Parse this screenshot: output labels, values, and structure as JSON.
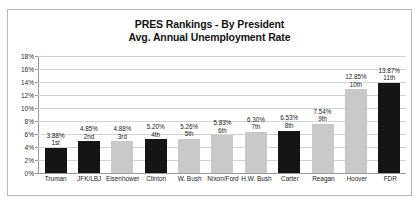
{
  "chart_data": {
    "type": "bar",
    "title": "PRES Rankings - By President",
    "subtitle": "Avg. Annual Unemployment Rate",
    "xlabel": "",
    "ylabel": "",
    "ylim": [
      0,
      18
    ],
    "ytick_labels": [
      "0%",
      "2%",
      "4%",
      "6%",
      "8%",
      "10%",
      "12%",
      "14%",
      "16%",
      "18%"
    ],
    "ytick_values": [
      0,
      2,
      4,
      6,
      8,
      10,
      12,
      14,
      16,
      18
    ],
    "grid": true,
    "legend": "none",
    "categories": [
      "Truman",
      "JFK/LBJ",
      "Eisenhower",
      "Clinton",
      "W. Bush",
      "Nixon/Ford",
      "H.W. Bush",
      "Carter",
      "Reagan",
      "Hoover",
      "FDR"
    ],
    "values": [
      3.88,
      4.85,
      4.88,
      5.2,
      5.26,
      5.83,
      6.3,
      6.53,
      7.54,
      12.85,
      13.87
    ],
    "value_labels": [
      "3.88%",
      "4.85%",
      "4.88%",
      "5.20%",
      "5.26%",
      "5.83%",
      "6.30%",
      "6.53%",
      "7.54%",
      "12.85%",
      "13.87%"
    ],
    "rank_labels": [
      "1st",
      "2nd",
      "3rd",
      "4th",
      "5th",
      "6th",
      "7th",
      "8th",
      "9th",
      "10th",
      "11th"
    ],
    "bar_colors": [
      "#151515",
      "#151515",
      "#c9c9c9",
      "#151515",
      "#c9c9c9",
      "#c9c9c9",
      "#c9c9c9",
      "#151515",
      "#c9c9c9",
      "#c9c9c9",
      "#151515"
    ],
    "colors": {
      "dark": "#151515",
      "light": "#c9c9c9",
      "gridline": "#d3d3d3",
      "axis": "#9a9a9a",
      "frame": "#b9b9b9",
      "text": "#1a1a1a",
      "background": "#ffffff"
    }
  }
}
